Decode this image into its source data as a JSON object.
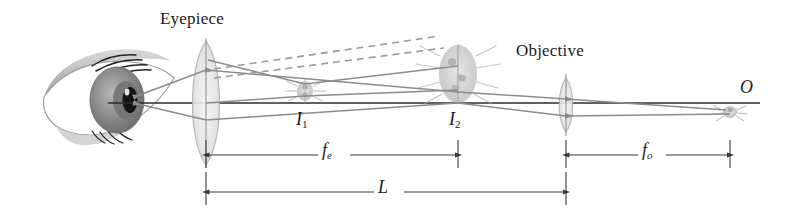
{
  "figure": {
    "kind": "compound-microscope-ray-diagram",
    "width": 788,
    "height": 223,
    "background_color": "#ffffff"
  },
  "labels": {
    "eyepiece": "Eyepiece",
    "objective": "Objective",
    "axis_point": "O",
    "image_one_base": "I",
    "image_one_sub": "1",
    "image_two_base": "I",
    "image_two_sub": "2",
    "focal_eyepiece_base": "f",
    "focal_eyepiece_sub": "e",
    "focal_objective_base": "f",
    "focal_objective_sub": "o",
    "tube_length": "L"
  },
  "colors": {
    "axis": "#2b2b2b",
    "ray": "#8c8c8c",
    "ray_dashed": "#9a9a9a",
    "lens_stroke": "#b5b5b5",
    "lens_fill": "#e8e8e8",
    "dimension": "#3a3a3a",
    "text": "#1a1a1a",
    "eye_dark": "#2a2a2a",
    "eye_mid": "#8f8f8f",
    "eye_light": "#cfcfcf",
    "specimen": "#a8a8a8"
  },
  "geometry": {
    "axis_y": 103,
    "axis_x_start": 108,
    "axis_x_end": 760,
    "eyepiece_x": 206,
    "objective_x": 566,
    "image_one_x": 305,
    "image_two_x": 458,
    "object_x": 730,
    "focal_eyepiece_row_y": 155,
    "focal_objective_row_y": 155,
    "tube_length_row_y": 192
  },
  "label_positions": {
    "eyepiece": {
      "x": 160,
      "y": 10
    },
    "objective": {
      "x": 516,
      "y": 42
    },
    "axis_point": {
      "x": 740,
      "y": 78
    },
    "image_one": {
      "x": 296,
      "y": 110
    },
    "image_two": {
      "x": 449,
      "y": 110
    },
    "focal_eyepiece": {
      "x": 322,
      "y": 141
    },
    "focal_objective": {
      "x": 642,
      "y": 141
    },
    "tube_length": {
      "x": 378,
      "y": 178
    }
  }
}
